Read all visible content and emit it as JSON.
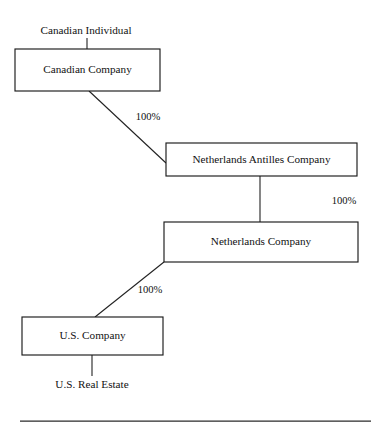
{
  "diagram": {
    "style": {
      "background": "#ffffff",
      "line_color": "#222222",
      "box_border_color": "#1a1a1a",
      "text_color": "#111111"
    },
    "nodes": [
      {
        "id": "canadian-individual",
        "label": "Canadian Individual",
        "shape": "plain",
        "x": 86,
        "y": 31
      },
      {
        "id": "canadian-company",
        "label": "Canadian Company",
        "shape": "box",
        "x": 15,
        "y": 49,
        "width": 145,
        "height": 42
      },
      {
        "id": "netherlands-antilles-company",
        "label": "Netherlands Antilles Company",
        "shape": "box",
        "x": 166,
        "y": 143,
        "width": 191,
        "height": 33
      },
      {
        "id": "netherlands-company",
        "label": "Netherlands Company",
        "shape": "box",
        "x": 164,
        "y": 222,
        "width": 194,
        "height": 40
      },
      {
        "id": "us-company",
        "label": "U.S. Company",
        "shape": "box",
        "x": 22,
        "y": 317,
        "width": 141,
        "height": 38
      },
      {
        "id": "us-real-estate",
        "label": "U.S. Real Estate",
        "shape": "plain",
        "x": 92,
        "y": 385
      }
    ],
    "edges": [
      {
        "id": "individual-to-canadian-company",
        "from": "canadian-individual",
        "to": "canadian-company",
        "kind": "vertical",
        "x1": 87,
        "y1": 38,
        "x2": 87,
        "y2": 49,
        "label": ""
      },
      {
        "id": "canadian-company-to-antilles",
        "from": "canadian-company",
        "to": "netherlands-antilles-company",
        "kind": "diagonal",
        "x1": 89,
        "y1": 91,
        "x2": 166,
        "y2": 163,
        "label": "100%",
        "label_x": 148,
        "label_y": 118
      },
      {
        "id": "antilles-to-netherlands",
        "from": "netherlands-antilles-company",
        "to": "netherlands-company",
        "kind": "vertical",
        "x1": 260,
        "y1": 176,
        "x2": 260,
        "y2": 222,
        "label": "100%",
        "label_x": 344,
        "label_y": 202
      },
      {
        "id": "netherlands-to-us-company",
        "from": "netherlands-company",
        "to": "us-company",
        "kind": "diagonal",
        "x1": 164,
        "y1": 262,
        "x2": 95,
        "y2": 317,
        "label": "100%",
        "label_x": 150,
        "label_y": 291
      },
      {
        "id": "us-company-to-real-estate",
        "from": "us-company",
        "to": "us-real-estate",
        "kind": "vertical",
        "x1": 92,
        "y1": 355,
        "x2": 92,
        "y2": 376,
        "label": ""
      }
    ],
    "footer_rule": {
      "x1": 20,
      "y1": 421,
      "x2": 371,
      "y2": 421
    }
  }
}
